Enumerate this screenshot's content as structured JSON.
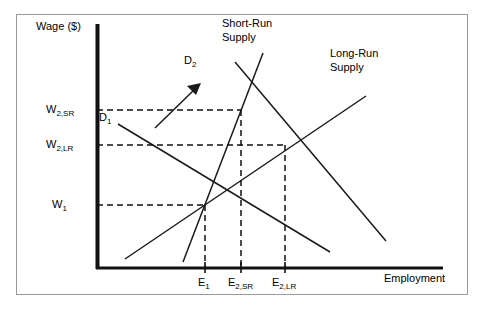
{
  "diagram": {
    "axes": {
      "y_label": "Wage ($)",
      "x_label": "Employment",
      "y_ticks": [
        {
          "name": "w2sr",
          "label": "W",
          "sub": "2,SR",
          "y": 110
        },
        {
          "name": "w2lr",
          "label": "W",
          "sub": "2,LR",
          "y": 145
        },
        {
          "name": "w1",
          "label": "W",
          "sub": "1",
          "y": 205
        }
      ],
      "x_ticks": [
        {
          "name": "e1",
          "label": "E",
          "sub": "1",
          "x": 205
        },
        {
          "name": "e2sr",
          "label": "E",
          "sub": "2,SR",
          "x": 241
        },
        {
          "name": "e2lr",
          "label": "E",
          "sub": "2,LR",
          "x": 285
        }
      ]
    },
    "curves": [
      {
        "name": "short-run-supply",
        "label_line1": "Short-Run",
        "label_line2": "Supply"
      },
      {
        "name": "long-run-supply",
        "label_line1": "Long-Run",
        "label_line2": "Supply"
      },
      {
        "name": "demand-1",
        "label": "D",
        "sub": "1"
      },
      {
        "name": "demand-2",
        "label": "D",
        "sub": "2"
      }
    ],
    "equilibria": [
      {
        "name": "initial-equilibrium",
        "x": 205,
        "y": 205,
        "wage": "W1",
        "employment": "E1"
      },
      {
        "name": "short-run-equilibrium",
        "x": 241,
        "y": 110,
        "wage": "W2,SR",
        "employment": "E2,SR"
      },
      {
        "name": "long-run-equilibrium",
        "x": 285,
        "y": 145,
        "wage": "W2,LR",
        "employment": "E2,LR"
      }
    ],
    "annotations": [
      {
        "name": "demand-shift-arrow",
        "description": "arrow pointing up-right from D1 to D2"
      }
    ],
    "colors": {
      "line": "#1a1a1a",
      "frame": "#9a9a9a",
      "background": "#ffffff"
    }
  }
}
